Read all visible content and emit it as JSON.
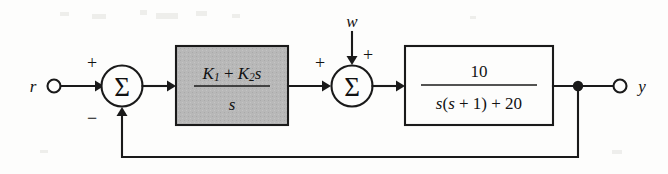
{
  "diagram": {
    "background_color": "#fdfdfc",
    "line_color": "#1a1a1a",
    "shaded_block_fill": "#b8b8b8"
  },
  "input": {
    "label": "r",
    "terminal": "open-circle"
  },
  "output": {
    "label": "y",
    "terminal": "open-circle"
  },
  "disturbance": {
    "label": "w"
  },
  "summer1": {
    "glyph": "Σ",
    "sign_reference": "+",
    "sign_feedback": "−"
  },
  "summer2": {
    "glyph": "Σ",
    "sign_forward": "+",
    "sign_disturbance": "+"
  },
  "controller_block": {
    "numerator_k1": "K",
    "numerator_k1_sub": "1",
    "numerator_plus": "+",
    "numerator_k2": "K",
    "numerator_k2_sub": "2",
    "numerator_s": "s",
    "denominator": "s",
    "shaded": true
  },
  "plant_block": {
    "numerator": "10",
    "denominator": "s(s + 1) + 20",
    "shaded": false
  }
}
